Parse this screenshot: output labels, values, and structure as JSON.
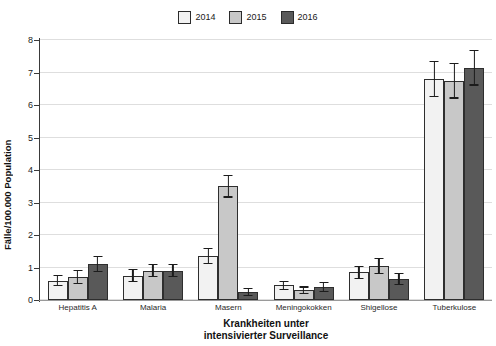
{
  "chart_data": {
    "type": "bar",
    "title": "",
    "xlabel": "Krankheiten unter intensivierter Surveillance",
    "xlabel_line1": "Krankheiten unter",
    "xlabel_line2": "intensivierter Surveillance",
    "ylabel": "Fälle/100.000 Population",
    "ylim": [
      0,
      8
    ],
    "yticks": [
      0,
      1,
      2,
      3,
      4,
      5,
      6,
      7,
      8
    ],
    "ytick_labels": [
      "0",
      "1",
      "2",
      "3",
      "4",
      "5",
      "6",
      "7",
      "8"
    ],
    "grid": true,
    "legend_position": "top-center",
    "categories": [
      "Hepatitis A",
      "Malaria",
      "Masern",
      "Meningokokken",
      "Shigellose",
      "Tuberkulose"
    ],
    "series": [
      {
        "name": "2014",
        "color": "#f2f2f2",
        "values": [
          0.6,
          0.75,
          1.35,
          0.45,
          0.85,
          6.8
        ],
        "err_low": [
          0.18,
          0.2,
          0.25,
          0.15,
          0.2,
          0.55
        ],
        "err_high": [
          0.18,
          0.2,
          0.25,
          0.15,
          0.2,
          0.55
        ]
      },
      {
        "name": "2015",
        "color": "#c8c8c8",
        "values": [
          0.7,
          0.9,
          3.5,
          0.3,
          1.05,
          6.75
        ],
        "err_low": [
          0.22,
          0.2,
          0.35,
          0.12,
          0.25,
          0.55
        ],
        "err_high": [
          0.22,
          0.2,
          0.35,
          0.12,
          0.25,
          0.55
        ]
      },
      {
        "name": "2016",
        "color": "#595959",
        "values": [
          1.1,
          0.9,
          0.25,
          0.4,
          0.65,
          7.15
        ],
        "err_low": [
          0.25,
          0.2,
          0.12,
          0.15,
          0.18,
          0.55
        ],
        "err_high": [
          0.25,
          0.2,
          0.12,
          0.15,
          0.18,
          0.55
        ]
      }
    ]
  },
  "legend": {
    "items": [
      {
        "label": "2014",
        "color": "#f2f2f2"
      },
      {
        "label": "2015",
        "color": "#c8c8c8"
      },
      {
        "label": "2016",
        "color": "#595959"
      }
    ]
  }
}
